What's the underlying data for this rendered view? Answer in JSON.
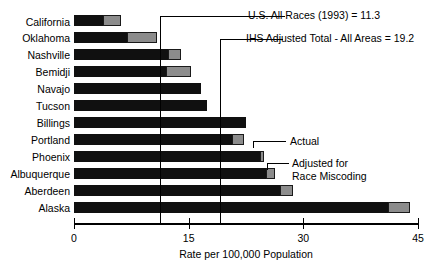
{
  "chart_data": {
    "type": "bar",
    "orientation": "horizontal",
    "title": "",
    "xlabel": "Rate per 100,000 Population",
    "ylabel": "",
    "xlim": [
      0,
      45
    ],
    "xticks": [
      0,
      15,
      30,
      45
    ],
    "xtick_labels": [
      "0",
      "15",
      "30",
      "45"
    ],
    "grid": false,
    "legend_position": "inline-callout",
    "categories": [
      "California",
      "Oklahoma",
      "Nashville",
      "Bemidji",
      "Navajo",
      "Tucson",
      "Billings",
      "Portland",
      "Phoenix",
      "Albuquerque",
      "Aberdeen",
      "Alaska"
    ],
    "series": [
      {
        "name": "Actual",
        "color": "#101010",
        "values": [
          3.8,
          6.9,
          12.3,
          12.0,
          16.6,
          17.4,
          22.5,
          20.7,
          24.3,
          25.1,
          27.0,
          41.1
        ]
      },
      {
        "name": "Adjusted for Race Miscoding",
        "color": "#8c8c8c",
        "values": [
          6.2,
          10.9,
          14.0,
          15.3,
          16.6,
          17.4,
          22.5,
          22.2,
          24.9,
          26.3,
          28.7,
          44.0
        ]
      }
    ],
    "reference_lines": [
      {
        "label": "U.S. All Races (1993) = 11.3",
        "value": 11.3
      },
      {
        "label": "IHS Adjusted Total - All Areas = 19.2",
        "value": 19.2
      }
    ],
    "callouts": [
      {
        "label": "Actual"
      },
      {
        "label": "Adjusted for\nRace Miscoding"
      }
    ]
  }
}
